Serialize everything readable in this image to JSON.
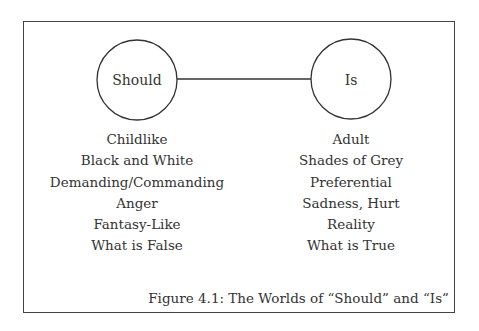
{
  "figure": {
    "caption": "Figure 4.1: The Worlds of “Should” and “Is”",
    "nodes": [
      {
        "label": "Should"
      },
      {
        "label": "Is"
      }
    ],
    "columns": [
      {
        "items": [
          "Childlike",
          "Black and White",
          "Demanding/Commanding",
          "Anger",
          "Fantasy-Like",
          "What is False"
        ]
      },
      {
        "items": [
          "Adult",
          "Shades of Grey",
          "Preferential",
          "Sadness, Hurt",
          "Reality",
          "What is True"
        ]
      }
    ]
  }
}
